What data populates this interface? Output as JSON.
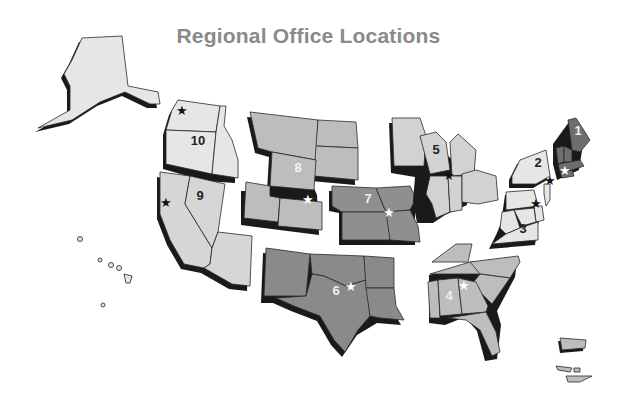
{
  "title": "Regional Office Locations",
  "colors": {
    "light": "#e6e6e6",
    "medium": "#bdbdbd",
    "dark": "#8f8f8f",
    "darkest": "#6e6e6e",
    "shadow": "#1a1a1a",
    "title": "#8a8a8a"
  },
  "regions": [
    {
      "id": "1",
      "label": "1",
      "states": [
        "Maine",
        "New Hampshire",
        "Vermont",
        "Massachusetts",
        "Rhode Island",
        "Connecticut"
      ],
      "office": "Boston",
      "star_color": "white"
    },
    {
      "id": "2",
      "label": "2",
      "states": [
        "New York",
        "New Jersey"
      ],
      "office": "New York",
      "star_color": "black"
    },
    {
      "id": "3",
      "label": "3",
      "states": [
        "Pennsylvania",
        "Delaware",
        "Maryland",
        "Virginia",
        "West Virginia"
      ],
      "office": "Philadelphia",
      "star_color": "black"
    },
    {
      "id": "4",
      "label": "4",
      "states": [
        "Kentucky",
        "Tennessee",
        "North Carolina",
        "South Carolina",
        "Mississippi",
        "Alabama",
        "Georgia",
        "Florida"
      ],
      "office": "Atlanta",
      "star_color": "white"
    },
    {
      "id": "5",
      "label": "5",
      "states": [
        "Minnesota",
        "Wisconsin",
        "Michigan",
        "Illinois",
        "Indiana",
        "Ohio"
      ],
      "office": "Chicago",
      "star_color": "black"
    },
    {
      "id": "6",
      "label": "6",
      "states": [
        "New Mexico",
        "Texas",
        "Oklahoma",
        "Arkansas",
        "Louisiana"
      ],
      "office": "Dallas",
      "star_color": "white"
    },
    {
      "id": "7",
      "label": "7",
      "states": [
        "Nebraska",
        "Iowa",
        "Kansas",
        "Missouri"
      ],
      "office": "Kansas City",
      "star_color": "white"
    },
    {
      "id": "8",
      "label": "8",
      "states": [
        "Montana",
        "North Dakota",
        "South Dakota",
        "Wyoming",
        "Utah",
        "Colorado"
      ],
      "office": "Denver",
      "star_color": "white"
    },
    {
      "id": "9",
      "label": "9",
      "states": [
        "California",
        "Nevada",
        "Arizona",
        "Hawaii"
      ],
      "office": "San Francisco",
      "star_color": "black"
    },
    {
      "id": "10",
      "label": "10",
      "states": [
        "Washington",
        "Oregon",
        "Idaho",
        "Alaska"
      ],
      "office": "Seattle",
      "star_color": "black"
    }
  ],
  "star_glyph": "★"
}
